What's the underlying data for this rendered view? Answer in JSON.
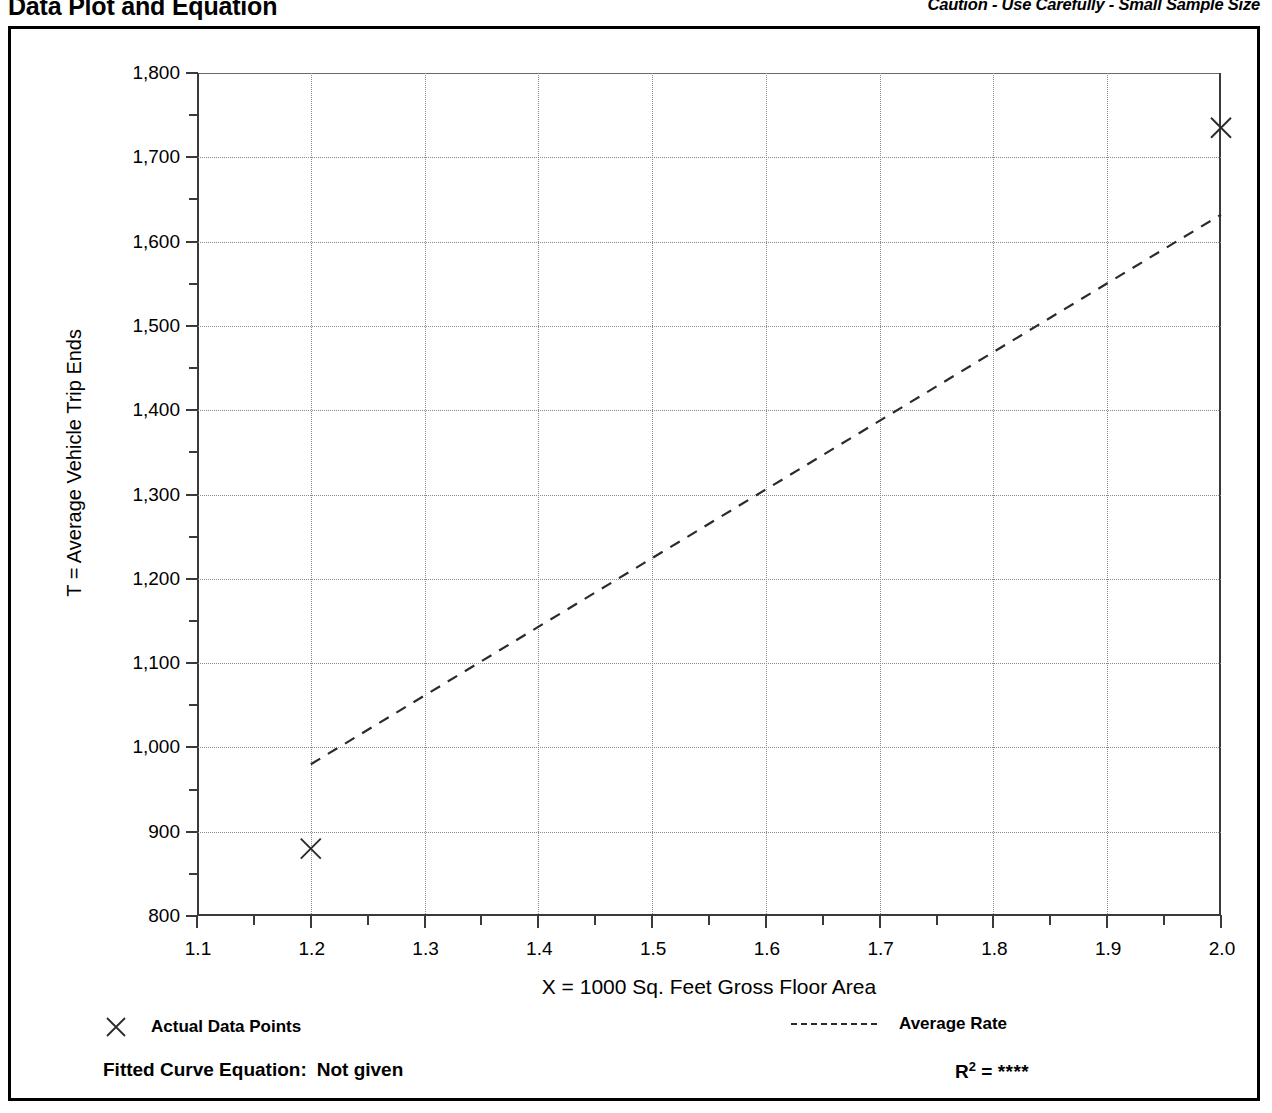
{
  "header": {
    "title": "Data Plot and Equation",
    "caution": "Caution - Use Carefully - Small Sample Size"
  },
  "legend": {
    "points_label": "Actual Data Points",
    "rate_label": "Average Rate",
    "point_marker": "x-marker-icon",
    "rate_marker": "dashed-line-icon"
  },
  "footer": {
    "fitted_label": "Fitted Curve Equation:",
    "fitted_value": "Not given",
    "rsq_label": "R",
    "rsq_exponent": "2",
    "rsq_equals": "=",
    "rsq_value": "****"
  },
  "chart_data": {
    "type": "scatter",
    "title": "Data Plot and Equation",
    "subtitle": "Caution - Use Carefully - Small Sample Size",
    "xlabel": "X = 1000 Sq. Feet Gross Floor Area",
    "ylabel": "T = Average Vehicle Trip Ends",
    "xlim": [
      1.1,
      2.0
    ],
    "ylim": [
      800,
      1800
    ],
    "xticks": [
      1.1,
      1.2,
      1.3,
      1.4,
      1.5,
      1.6,
      1.7,
      1.8,
      1.9,
      2.0
    ],
    "xtick_labels": [
      "1.1",
      "1.2",
      "1.3",
      "1.4",
      "1.5",
      "1.6",
      "1.7",
      "1.8",
      "1.9",
      "2.0"
    ],
    "yticks": [
      800,
      900,
      1000,
      1100,
      1200,
      1300,
      1400,
      1500,
      1600,
      1700,
      1800
    ],
    "ytick_labels": [
      "800",
      "900",
      "1,000",
      "1,100",
      "1,200",
      "1,300",
      "1,400",
      "1,500",
      "1,600",
      "1,700",
      "1,800"
    ],
    "y_minor_ticks": [
      850,
      950,
      1050,
      1150,
      1250,
      1350,
      1450,
      1550,
      1650,
      1750
    ],
    "x_minor_ticks": [
      1.15,
      1.25,
      1.35,
      1.45,
      1.55,
      1.65,
      1.75,
      1.85,
      1.95
    ],
    "grid": true,
    "grid_style": "dotted",
    "legend_position": "below-plot",
    "series": [
      {
        "name": "Actual Data Points",
        "type": "scatter",
        "marker": "x",
        "points": [
          {
            "x": 1.2,
            "y": 880
          },
          {
            "x": 2.0,
            "y": 1735
          }
        ]
      },
      {
        "name": "Average Rate",
        "type": "line",
        "style": "dashed",
        "points": [
          {
            "x": 1.2,
            "y": 980
          },
          {
            "x": 2.0,
            "y": 1632
          }
        ]
      }
    ]
  }
}
